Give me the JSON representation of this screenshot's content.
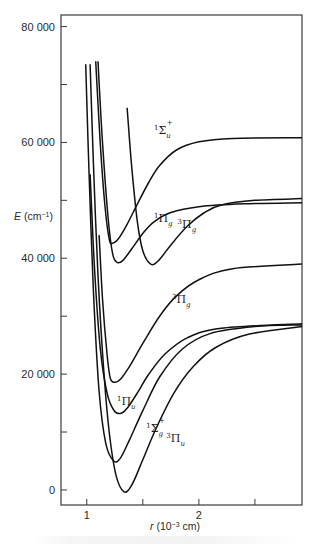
{
  "chart_data": {
    "type": "line",
    "title": "",
    "xlabel": "r (10⁻³ cm)",
    "ylabel": "E (cm⁻¹)",
    "xlim": [
      0.77,
      2.92
    ],
    "ylim": [
      -2600,
      82000
    ],
    "grid": false,
    "legend": "none (labels placed on curves)",
    "x_ticks": [
      {
        "value": 1,
        "label": "1"
      },
      {
        "value": 1.5,
        "label": ""
      },
      {
        "value": 2,
        "label": "2"
      },
      {
        "value": 2.5,
        "label": ""
      }
    ],
    "y_ticks": [
      {
        "value": 0,
        "label": "0"
      },
      {
        "value": 10000,
        "label": ""
      },
      {
        "value": 20000,
        "label": "20 000"
      },
      {
        "value": 30000,
        "label": ""
      },
      {
        "value": 40000,
        "label": "40 000"
      },
      {
        "value": 50000,
        "label": ""
      },
      {
        "value": 60000,
        "label": "60 000"
      },
      {
        "value": 70000,
        "label": ""
      },
      {
        "value": 80000,
        "label": "80 000"
      }
    ],
    "series": [
      {
        "name": "1Σu+",
        "label_main": "Σ",
        "label_sup_left": "1",
        "label_sub": "u",
        "label_sup_right": "+",
        "label_at": [
          1.6,
          61500
        ],
        "points": [
          [
            1.08,
            74000
          ],
          [
            1.12,
            60000
          ],
          [
            1.16,
            49500
          ],
          [
            1.2,
            43300
          ],
          [
            1.23,
            42600
          ],
          [
            1.28,
            43300
          ],
          [
            1.35,
            45500
          ],
          [
            1.45,
            49300
          ],
          [
            1.55,
            53000
          ],
          [
            1.65,
            56000
          ],
          [
            1.8,
            58700
          ],
          [
            2.0,
            60100
          ],
          [
            2.3,
            60700
          ],
          [
            2.92,
            60800
          ]
        ]
      },
      {
        "name": "1Πg",
        "label_main": "Π",
        "label_sup_left": "1",
        "label_sub": "g",
        "label_sup_right": "",
        "label_at": [
          1.6,
          46300
        ],
        "points": [
          [
            1.1,
            74000
          ],
          [
            1.14,
            60000
          ],
          [
            1.19,
            47000
          ],
          [
            1.23,
            40800
          ],
          [
            1.27,
            39300
          ],
          [
            1.32,
            39600
          ],
          [
            1.4,
            41600
          ],
          [
            1.5,
            44300
          ],
          [
            1.6,
            46300
          ],
          [
            1.75,
            47900
          ],
          [
            2.0,
            48900
          ],
          [
            2.4,
            49400
          ],
          [
            2.92,
            49600
          ]
        ]
      },
      {
        "name": "3Πg (upper)",
        "label_main": "Π",
        "label_sup_left": "3",
        "label_sub": "g",
        "label_sup_right": "",
        "label_at": [
          1.81,
          45300
        ],
        "points": [
          [
            1.36,
            66000
          ],
          [
            1.4,
            56000
          ],
          [
            1.45,
            46500
          ],
          [
            1.5,
            41300
          ],
          [
            1.57,
            39000
          ],
          [
            1.64,
            39600
          ],
          [
            1.75,
            42300
          ],
          [
            1.9,
            45600
          ],
          [
            2.05,
            47900
          ],
          [
            2.2,
            49200
          ],
          [
            2.5,
            50000
          ],
          [
            2.92,
            50300
          ]
        ]
      },
      {
        "name": "3Πg (lower)",
        "label_main": "Π",
        "label_sup_left": "3",
        "label_sub": "g",
        "label_sup_right": "",
        "label_at": [
          1.76,
          32200
        ],
        "points": [
          [
            1.11,
            44000
          ],
          [
            1.14,
            33000
          ],
          [
            1.18,
            23500
          ],
          [
            1.21,
            19300
          ],
          [
            1.25,
            18600
          ],
          [
            1.3,
            19100
          ],
          [
            1.38,
            21300
          ],
          [
            1.5,
            25300
          ],
          [
            1.65,
            30000
          ],
          [
            1.8,
            33500
          ],
          [
            2.0,
            36300
          ],
          [
            2.3,
            38200
          ],
          [
            2.92,
            39000
          ]
        ]
      },
      {
        "name": "1Πu",
        "label_main": "Π",
        "label_sup_left": "1",
        "label_sub": "u",
        "label_sup_right": "",
        "label_at": [
          1.27,
          14700
        ],
        "points": [
          [
            1.03,
            54500
          ],
          [
            1.07,
            38000
          ],
          [
            1.12,
            24500
          ],
          [
            1.18,
            16800
          ],
          [
            1.24,
            13800
          ],
          [
            1.3,
            13200
          ],
          [
            1.36,
            14100
          ],
          [
            1.45,
            16700
          ],
          [
            1.55,
            19900
          ],
          [
            1.7,
            23500
          ],
          [
            1.9,
            26300
          ],
          [
            2.2,
            27900
          ],
          [
            2.92,
            28700
          ]
        ]
      },
      {
        "name": "1Σg+",
        "label_main": "Σ",
        "label_sup_left": "1",
        "label_sub": "g",
        "label_sup_right": "+",
        "label_at": [
          1.53,
          10000
        ],
        "points": [
          [
            0.99,
            73500
          ],
          [
            1.02,
            55000
          ],
          [
            1.06,
            34000
          ],
          [
            1.11,
            17000
          ],
          [
            1.17,
            8000
          ],
          [
            1.24,
            5000
          ],
          [
            1.3,
            5500
          ],
          [
            1.38,
            8600
          ],
          [
            1.5,
            13700
          ],
          [
            1.65,
            19500
          ],
          [
            1.85,
            24300
          ],
          [
            2.1,
            27000
          ],
          [
            2.5,
            28200
          ],
          [
            2.92,
            28500
          ]
        ]
      },
      {
        "name": "3Πu",
        "label_main": "Π",
        "label_sup_left": "3",
        "label_sub": "u",
        "label_sup_right": "",
        "label_at": [
          1.71,
          8300
        ],
        "points": [
          [
            1.03,
            73500
          ],
          [
            1.06,
            56000
          ],
          [
            1.1,
            37000
          ],
          [
            1.15,
            21000
          ],
          [
            1.2,
            10000
          ],
          [
            1.26,
            2600
          ],
          [
            1.33,
            -300
          ],
          [
            1.4,
            800
          ],
          [
            1.5,
            5200
          ],
          [
            1.62,
            10700
          ],
          [
            1.78,
            16800
          ],
          [
            1.95,
            21300
          ],
          [
            2.15,
            24600
          ],
          [
            2.45,
            26900
          ],
          [
            2.92,
            28200
          ]
        ]
      }
    ]
  },
  "caption_visible": false
}
